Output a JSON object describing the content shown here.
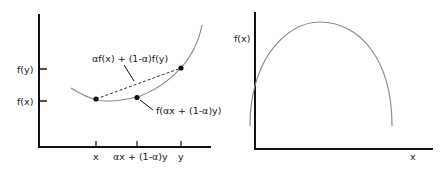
{
  "left_panel": {
    "title": "Convex function",
    "y_tick_labels": {
      "fy": "f(y)",
      "fx": "f(x)"
    },
    "x_tick_labels": {
      "x": "x",
      "mix": "αx + (1-α)y",
      "y": "y"
    },
    "annotations": {
      "chord": "αf(x) + (1-α)f(y)",
      "curve_point": "f(αx + (1-α)y)"
    }
  },
  "right_panel": {
    "title": "Concave function",
    "y_label": "f(x)",
    "x_label": "x"
  },
  "colors": {
    "axis": "#111111",
    "curve": "#8a8a8a",
    "point": "#111111",
    "text": "#1a1a1a"
  }
}
